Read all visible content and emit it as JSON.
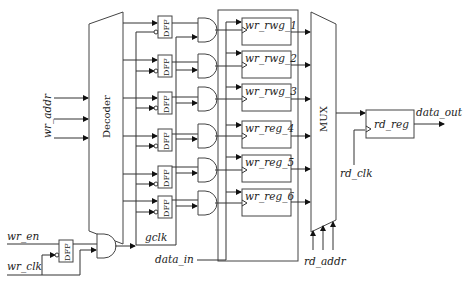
{
  "diagram": {
    "decoder": {
      "label": "Decoder"
    },
    "mux": {
      "label": "MUX"
    },
    "dff_label": "DFF",
    "registers": [
      {
        "label": "wr_rwg_1"
      },
      {
        "label": "wr_rwg_2"
      },
      {
        "label": "wr_rwg_3"
      },
      {
        "label": "wr_reg_4"
      },
      {
        "label": "wr_reg_5"
      },
      {
        "label": "wr_reg_6"
      }
    ],
    "read_register": {
      "label": "rd_reg"
    },
    "signals": {
      "wr_addr": "wr_addr",
      "wr_en": "wr_en",
      "wr_clk": "wr_clk",
      "gclk": "gclk",
      "data_in": "data_in",
      "rd_addr": "rd_addr",
      "rd_clk": "rd_clk",
      "data_out": "data_out"
    },
    "colors": {
      "line": "#333333",
      "background": "#ffffff"
    }
  }
}
